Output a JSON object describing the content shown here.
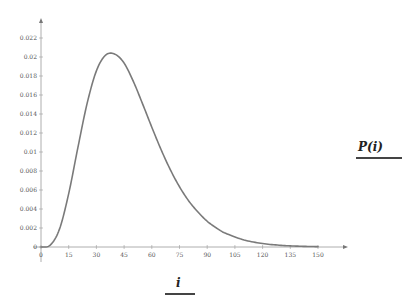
{
  "chart_data": {
    "type": "line",
    "title": "",
    "xlabel": "i",
    "ylabel": "P(i)",
    "xlim": [
      0,
      150
    ],
    "ylim": [
      0,
      0.022
    ],
    "grid": false,
    "legend": null,
    "x_ticks": [
      0,
      15,
      30,
      45,
      60,
      75,
      90,
      105,
      120,
      135,
      150
    ],
    "x_tick_labels": [
      "0",
      "15",
      "30",
      "45",
      "60",
      "75",
      "90",
      "105",
      "120",
      "135",
      "150"
    ],
    "y_ticks": [
      0,
      0.002,
      0.004,
      0.006,
      0.008,
      0.01,
      0.012,
      0.014,
      0.016,
      0.018,
      0.02,
      0.022
    ],
    "y_tick_labels": [
      "0",
      "0.002",
      "0.004",
      "0.006",
      "0.008",
      "0.01",
      "0.012",
      "0.014",
      "0.016",
      "0.018",
      "0.02",
      "0.022"
    ],
    "series": [
      {
        "name": "P(i)",
        "color": "#7a7a7a",
        "x": [
          0,
          5,
          10,
          15,
          20,
          25,
          30,
          35,
          40,
          45,
          50,
          55,
          60,
          65,
          70,
          75,
          80,
          85,
          90,
          95,
          100,
          110,
          120,
          130,
          140,
          150
        ],
        "y": [
          0,
          0.0002,
          0.00188,
          0.00562,
          0.01049,
          0.01514,
          0.01854,
          0.0202,
          0.0203,
          0.01936,
          0.01743,
          0.01507,
          0.01261,
          0.01026,
          0.00815,
          0.00634,
          0.00485,
          0.00368,
          0.00271,
          0.002,
          0.00144,
          0.00074,
          0.000365,
          0.000175,
          8.23e-05,
          3.79e-05
        ]
      }
    ]
  },
  "labels": {
    "y_axis_label": "P(i)",
    "x_axis_label": "i"
  }
}
